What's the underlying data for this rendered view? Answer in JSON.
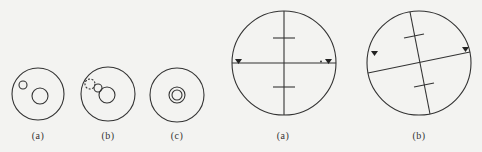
{
  "colors": {
    "background": "#f3f3f1",
    "stroke": "#333333"
  },
  "left_panel": {
    "figures": [
      {
        "label": "(a)",
        "description": "outer circle with small offset circle and medium circle, separated"
      },
      {
        "label": "(b)",
        "description": "outer circle with dashed circle, small circle touching medium circle"
      },
      {
        "label": "(c)",
        "description": "outer circle with concentric inner pair"
      }
    ]
  },
  "right_panel": {
    "figures": [
      {
        "label": "(a)",
        "description": "reticle with horizontal crosshair aligned, two triangle markers and stadia ticks"
      },
      {
        "label": "(b)",
        "description": "reticle with rotated crosshair, two triangle markers and stadia ticks"
      }
    ]
  }
}
